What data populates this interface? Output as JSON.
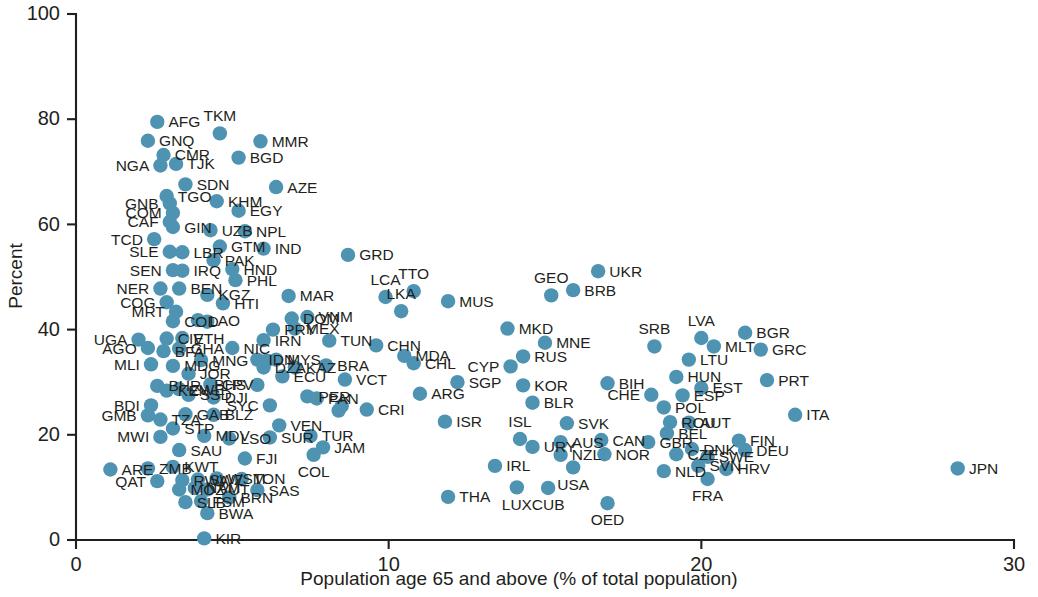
{
  "chart_data": {
    "type": "scatter",
    "title": "",
    "subtitle": "",
    "xlabel": "Population age 65 and above (% of total population)",
    "ylabel": "Percent",
    "xlim": [
      0,
      30
    ],
    "ylim": [
      0,
      100
    ],
    "xticks": [
      0,
      10,
      20,
      30
    ],
    "yticks": [
      0,
      20,
      40,
      60,
      80,
      100
    ],
    "grid": false,
    "legend": "none",
    "marker_color": "#4e93b2",
    "axis_color": "#231f20",
    "point_label_field": "iso3",
    "points": [
      {
        "iso3": "AFG",
        "x": 2.6,
        "y": 79.5,
        "lp": "right"
      },
      {
        "iso3": "GNQ",
        "x": 2.3,
        "y": 75.9,
        "lp": "right"
      },
      {
        "iso3": "CMR",
        "x": 2.8,
        "y": 73.2,
        "lp": "right"
      },
      {
        "iso3": "NGA",
        "x": 2.7,
        "y": 71.2,
        "lp": "left"
      },
      {
        "iso3": "TJK",
        "x": 3.2,
        "y": 71.5,
        "lp": "right"
      },
      {
        "iso3": "TKM",
        "x": 4.6,
        "y": 77.3,
        "lp": "above"
      },
      {
        "iso3": "MMR",
        "x": 5.9,
        "y": 75.8,
        "lp": "right"
      },
      {
        "iso3": "BGD",
        "x": 5.2,
        "y": 72.7,
        "lp": "right"
      },
      {
        "iso3": "SDN",
        "x": 3.5,
        "y": 67.6,
        "lp": "right"
      },
      {
        "iso3": "AZE",
        "x": 6.4,
        "y": 67.1,
        "lp": "right"
      },
      {
        "iso3": "TGO",
        "x": 2.9,
        "y": 65.4,
        "lp": "right"
      },
      {
        "iso3": "GNB",
        "x": 3.0,
        "y": 64.0,
        "lp": "left"
      },
      {
        "iso3": "KHM",
        "x": 4.5,
        "y": 64.4,
        "lp": "right"
      },
      {
        "iso3": "COM",
        "x": 3.1,
        "y": 62.2,
        "lp": "left"
      },
      {
        "iso3": "EGY",
        "x": 5.2,
        "y": 62.6,
        "lp": "right"
      },
      {
        "iso3": "CAF",
        "x": 3.0,
        "y": 60.5,
        "lp": "left"
      },
      {
        "iso3": "GIN",
        "x": 3.1,
        "y": 59.5,
        "lp": "right"
      },
      {
        "iso3": "UZB",
        "x": 4.3,
        "y": 58.9,
        "lp": "right"
      },
      {
        "iso3": "NPL",
        "x": 5.4,
        "y": 58.7,
        "lp": "right"
      },
      {
        "iso3": "TCD",
        "x": 2.5,
        "y": 57.2,
        "lp": "left"
      },
      {
        "iso3": "GTM",
        "x": 4.6,
        "y": 55.8,
        "lp": "right"
      },
      {
        "iso3": "IND",
        "x": 6.0,
        "y": 55.4,
        "lp": "right"
      },
      {
        "iso3": "SLE",
        "x": 3.0,
        "y": 54.8,
        "lp": "left"
      },
      {
        "iso3": "LBR",
        "x": 3.4,
        "y": 54.7,
        "lp": "right"
      },
      {
        "iso3": "PAK",
        "x": 4.4,
        "y": 53.2,
        "lp": "right"
      },
      {
        "iso3": "GRD",
        "x": 8.7,
        "y": 54.2,
        "lp": "right"
      },
      {
        "iso3": "SEN",
        "x": 3.1,
        "y": 51.3,
        "lp": "left"
      },
      {
        "iso3": "IRQ",
        "x": 3.4,
        "y": 51.2,
        "lp": "right"
      },
      {
        "iso3": "HND",
        "x": 5.0,
        "y": 51.5,
        "lp": "right"
      },
      {
        "iso3": "PHL",
        "x": 5.1,
        "y": 49.4,
        "lp": "right"
      },
      {
        "iso3": "LCA",
        "x": 9.9,
        "y": 46.2,
        "lp": "above"
      },
      {
        "iso3": "TTO",
        "x": 10.8,
        "y": 47.3,
        "lp": "above"
      },
      {
        "iso3": "GEO",
        "x": 15.2,
        "y": 46.5,
        "lp": "above"
      },
      {
        "iso3": "UKR",
        "x": 16.7,
        "y": 51.1,
        "lp": "right"
      },
      {
        "iso3": "NER",
        "x": 2.7,
        "y": 47.8,
        "lp": "left"
      },
      {
        "iso3": "BEN",
        "x": 3.3,
        "y": 47.8,
        "lp": "right"
      },
      {
        "iso3": "KGZ",
        "x": 4.2,
        "y": 46.6,
        "lp": "right"
      },
      {
        "iso3": "COG",
        "x": 2.9,
        "y": 45.2,
        "lp": "left"
      },
      {
        "iso3": "MRT",
        "x": 3.2,
        "y": 43.4,
        "lp": "left"
      },
      {
        "iso3": "HTI",
        "x": 4.7,
        "y": 45.0,
        "lp": "right"
      },
      {
        "iso3": "MAR",
        "x": 6.8,
        "y": 46.4,
        "lp": "right"
      },
      {
        "iso3": "BRB",
        "x": 15.9,
        "y": 47.5,
        "lp": "right"
      },
      {
        "iso3": "MUS",
        "x": 11.9,
        "y": 45.4,
        "lp": "right"
      },
      {
        "iso3": "LKA",
        "x": 10.4,
        "y": 43.5,
        "lp": "above"
      },
      {
        "iso3": "DOM",
        "x": 6.9,
        "y": 42.1,
        "lp": "right"
      },
      {
        "iso3": "VNM",
        "x": 7.4,
        "y": 42.4,
        "lp": "right"
      },
      {
        "iso3": "COD",
        "x": 3.1,
        "y": 41.6,
        "lp": "right"
      },
      {
        "iso3": "LAO",
        "x": 3.9,
        "y": 41.8,
        "lp": "right"
      },
      {
        "iso3": "HTI2",
        "x": 4.2,
        "y": 41.5,
        "lp": "hidden"
      },
      {
        "iso3": "PRY",
        "x": 6.3,
        "y": 40.0,
        "lp": "right"
      },
      {
        "iso3": "MEX",
        "x": 7.0,
        "y": 40.2,
        "lp": "right"
      },
      {
        "iso3": "IRN",
        "x": 6.0,
        "y": 38.0,
        "lp": "right"
      },
      {
        "iso3": "CIV",
        "x": 2.9,
        "y": 38.3,
        "lp": "right"
      },
      {
        "iso3": "ETH",
        "x": 3.4,
        "y": 38.4,
        "lp": "right"
      },
      {
        "iso3": "UGA",
        "x": 2.0,
        "y": 38.1,
        "lp": "left"
      },
      {
        "iso3": "AGO",
        "x": 2.3,
        "y": 36.5,
        "lp": "left"
      },
      {
        "iso3": "BFA",
        "x": 2.8,
        "y": 35.9,
        "lp": "right"
      },
      {
        "iso3": "GHA",
        "x": 3.3,
        "y": 36.4,
        "lp": "right"
      },
      {
        "iso3": "NIC",
        "x": 5.0,
        "y": 36.5,
        "lp": "right"
      },
      {
        "iso3": "TUN",
        "x": 8.1,
        "y": 37.9,
        "lp": "right"
      },
      {
        "iso3": "CHN",
        "x": 9.6,
        "y": 37.0,
        "lp": "right"
      },
      {
        "iso3": "MKD",
        "x": 13.8,
        "y": 40.2,
        "lp": "right"
      },
      {
        "iso3": "MNE",
        "x": 15.0,
        "y": 37.5,
        "lp": "right"
      },
      {
        "iso3": "SRB",
        "x": 18.5,
        "y": 36.8,
        "lp": "above"
      },
      {
        "iso3": "LVA",
        "x": 20.0,
        "y": 38.4,
        "lp": "above"
      },
      {
        "iso3": "BGR",
        "x": 21.4,
        "y": 39.4,
        "lp": "right"
      },
      {
        "iso3": "MLT",
        "x": 20.4,
        "y": 36.8,
        "lp": "right"
      },
      {
        "iso3": "GRC",
        "x": 21.9,
        "y": 36.2,
        "lp": "right"
      },
      {
        "iso3": "MDA",
        "x": 10.5,
        "y": 35.0,
        "lp": "right"
      },
      {
        "iso3": "CHL",
        "x": 10.8,
        "y": 33.6,
        "lp": "right"
      },
      {
        "iso3": "RUS",
        "x": 14.3,
        "y": 34.9,
        "lp": "right"
      },
      {
        "iso3": "CYP",
        "x": 13.9,
        "y": 33.0,
        "lp": "left"
      },
      {
        "iso3": "LTU",
        "x": 19.6,
        "y": 34.3,
        "lp": "right"
      },
      {
        "iso3": "MLI",
        "x": 2.4,
        "y": 33.4,
        "lp": "left"
      },
      {
        "iso3": "MDG",
        "x": 3.1,
        "y": 33.1,
        "lp": "right"
      },
      {
        "iso3": "MNG",
        "x": 4.0,
        "y": 34.2,
        "lp": "right"
      },
      {
        "iso3": "JOR",
        "x": 3.6,
        "y": 31.6,
        "lp": "right"
      },
      {
        "iso3": "IDN",
        "x": 5.8,
        "y": 34.3,
        "lp": "right"
      },
      {
        "iso3": "KHM2",
        "x": 6.1,
        "y": 34.1,
        "lp": "hidden"
      },
      {
        "iso3": "MYS",
        "x": 6.4,
        "y": 34.3,
        "lp": "right"
      },
      {
        "iso3": "DZA",
        "x": 6.0,
        "y": 32.8,
        "lp": "right"
      },
      {
        "iso3": "BRA",
        "x": 8.0,
        "y": 33.2,
        "lp": "right"
      },
      {
        "iso3": "KAZ",
        "x": 7.0,
        "y": 32.8,
        "lp": "right"
      },
      {
        "iso3": "ECU",
        "x": 6.6,
        "y": 31.1,
        "lp": "right"
      },
      {
        "iso3": "BHR",
        "x": 2.6,
        "y": 29.3,
        "lp": "right"
      },
      {
        "iso3": "KEN",
        "x": 2.9,
        "y": 28.4,
        "lp": "right"
      },
      {
        "iso3": "ZWE",
        "x": 3.3,
        "y": 28.7,
        "lp": "right"
      },
      {
        "iso3": "SSD",
        "x": 3.6,
        "y": 27.6,
        "lp": "right"
      },
      {
        "iso3": "CPV",
        "x": 4.3,
        "y": 29.6,
        "lp": "right"
      },
      {
        "iso3": "DJI",
        "x": 4.4,
        "y": 27.1,
        "lp": "right"
      },
      {
        "iso3": "BHS",
        "x": 5.8,
        "y": 29.5,
        "lp": "left"
      },
      {
        "iso3": "VCT",
        "x": 8.6,
        "y": 30.5,
        "lp": "right"
      },
      {
        "iso3": "SGP",
        "x": 12.2,
        "y": 30.0,
        "lp": "right"
      },
      {
        "iso3": "KOR",
        "x": 14.3,
        "y": 29.4,
        "lp": "right"
      },
      {
        "iso3": "BIH",
        "x": 17.0,
        "y": 29.8,
        "lp": "right"
      },
      {
        "iso3": "HUN",
        "x": 19.2,
        "y": 31.0,
        "lp": "right"
      },
      {
        "iso3": "EST",
        "x": 20.0,
        "y": 28.9,
        "lp": "right"
      },
      {
        "iso3": "PRT",
        "x": 22.1,
        "y": 30.4,
        "lp": "right"
      },
      {
        "iso3": "PER",
        "x": 7.4,
        "y": 27.3,
        "lp": "right"
      },
      {
        "iso3": "PAN",
        "x": 7.7,
        "y": 26.9,
        "lp": "right"
      },
      {
        "iso3": "ARG",
        "x": 11.0,
        "y": 27.8,
        "lp": "right"
      },
      {
        "iso3": "CHE",
        "x": 18.4,
        "y": 27.6,
        "lp": "left"
      },
      {
        "iso3": "ESP",
        "x": 19.4,
        "y": 27.5,
        "lp": "right"
      },
      {
        "iso3": "BDI",
        "x": 2.4,
        "y": 25.6,
        "lp": "left"
      },
      {
        "iso3": "GMB",
        "x": 2.3,
        "y": 23.7,
        "lp": "left"
      },
      {
        "iso3": "TZA",
        "x": 2.7,
        "y": 22.9,
        "lp": "right"
      },
      {
        "iso3": "GAB",
        "x": 3.5,
        "y": 23.9,
        "lp": "right"
      },
      {
        "iso3": "BLZ",
        "x": 4.4,
        "y": 23.8,
        "lp": "right"
      },
      {
        "iso3": "SYC",
        "x": 6.2,
        "y": 25.6,
        "lp": "left"
      },
      {
        "iso3": "BRA2",
        "x": 8.5,
        "y": 25.5,
        "lp": "hidden"
      },
      {
        "iso3": "AFG2",
        "x": 8.4,
        "y": 24.6,
        "lp": "hidden"
      },
      {
        "iso3": "CRI",
        "x": 9.3,
        "y": 24.8,
        "lp": "right"
      },
      {
        "iso3": "ISR",
        "x": 11.8,
        "y": 22.5,
        "lp": "right"
      },
      {
        "iso3": "BLR",
        "x": 14.6,
        "y": 26.1,
        "lp": "right"
      },
      {
        "iso3": "POL",
        "x": 18.8,
        "y": 25.2,
        "lp": "right"
      },
      {
        "iso3": "ITA",
        "x": 23.0,
        "y": 23.8,
        "lp": "right"
      },
      {
        "iso3": "STP",
        "x": 3.1,
        "y": 21.2,
        "lp": "right"
      },
      {
        "iso3": "VEN",
        "x": 6.5,
        "y": 21.8,
        "lp": "right"
      },
      {
        "iso3": "TUR",
        "x": 7.5,
        "y": 19.8,
        "lp": "right"
      },
      {
        "iso3": "SVK",
        "x": 15.7,
        "y": 22.2,
        "lp": "right"
      },
      {
        "iso3": "ROU",
        "x": 19.0,
        "y": 22.4,
        "lp": "right"
      },
      {
        "iso3": "AUT",
        "x": 19.6,
        "y": 22.3,
        "lp": "right"
      },
      {
        "iso3": "MWI",
        "x": 2.7,
        "y": 19.6,
        "lp": "left"
      },
      {
        "iso3": "MDV",
        "x": 4.1,
        "y": 19.8,
        "lp": "right"
      },
      {
        "iso3": "LSO",
        "x": 4.9,
        "y": 19.3,
        "lp": "right"
      },
      {
        "iso3": "SUR",
        "x": 6.2,
        "y": 19.5,
        "lp": "right"
      },
      {
        "iso3": "ISL",
        "x": 14.2,
        "y": 19.2,
        "lp": "above"
      },
      {
        "iso3": "FIN",
        "x": 21.2,
        "y": 18.9,
        "lp": "right"
      },
      {
        "iso3": "BEL",
        "x": 18.9,
        "y": 20.3,
        "lp": "right"
      },
      {
        "iso3": "SAU",
        "x": 3.3,
        "y": 17.1,
        "lp": "right"
      },
      {
        "iso3": "JAM",
        "x": 7.9,
        "y": 17.6,
        "lp": "right"
      },
      {
        "iso3": "COL",
        "x": 7.6,
        "y": 16.2,
        "lp": "below"
      },
      {
        "iso3": "AUS",
        "x": 15.5,
        "y": 18.6,
        "lp": "right"
      },
      {
        "iso3": "CAN",
        "x": 16.8,
        "y": 19.0,
        "lp": "right"
      },
      {
        "iso3": "GBR",
        "x": 18.3,
        "y": 18.6,
        "lp": "right"
      },
      {
        "iso3": "URY",
        "x": 14.6,
        "y": 17.7,
        "lp": "right"
      },
      {
        "iso3": "ARE",
        "x": 1.1,
        "y": 13.4,
        "lp": "right"
      },
      {
        "iso3": "ZMB",
        "x": 2.3,
        "y": 13.6,
        "lp": "right"
      },
      {
        "iso3": "KWT",
        "x": 3.1,
        "y": 13.9,
        "lp": "right"
      },
      {
        "iso3": "FJI",
        "x": 5.4,
        "y": 15.5,
        "lp": "right"
      },
      {
        "iso3": "NZL",
        "x": 15.5,
        "y": 16.2,
        "lp": "right"
      },
      {
        "iso3": "NOR",
        "x": 16.9,
        "y": 16.3,
        "lp": "right"
      },
      {
        "iso3": "DNK",
        "x": 19.7,
        "y": 17.3,
        "lp": "right"
      },
      {
        "iso3": "CZE",
        "x": 19.2,
        "y": 16.3,
        "lp": "right"
      },
      {
        "iso3": "SWE",
        "x": 20.2,
        "y": 15.8,
        "lp": "right"
      },
      {
        "iso3": "DEU",
        "x": 21.4,
        "y": 17.1,
        "lp": "right"
      },
      {
        "iso3": "IRL",
        "x": 13.4,
        "y": 14.1,
        "lp": "right"
      },
      {
        "iso3": "QAT",
        "x": 2.6,
        "y": 11.2,
        "lp": "left"
      },
      {
        "iso3": "RWA",
        "x": 3.4,
        "y": 11.4,
        "lp": "right"
      },
      {
        "iso3": "SWZ",
        "x": 3.9,
        "y": 11.5,
        "lp": "right"
      },
      {
        "iso3": "WSM",
        "x": 4.5,
        "y": 11.7,
        "lp": "right"
      },
      {
        "iso3": "TON",
        "x": 5.3,
        "y": 11.6,
        "lp": "right"
      },
      {
        "iso3": "MOZ",
        "x": 3.3,
        "y": 9.6,
        "lp": "right"
      },
      {
        "iso3": "NAM",
        "x": 3.8,
        "y": 9.9,
        "lp": "right"
      },
      {
        "iso3": "VUT",
        "x": 4.2,
        "y": 9.6,
        "lp": "right"
      },
      {
        "iso3": "SAS",
        "x": 5.8,
        "y": 9.5,
        "lp": "right"
      },
      {
        "iso3": "SLB",
        "x": 3.5,
        "y": 7.2,
        "lp": "right"
      },
      {
        "iso3": "FSM",
        "x": 4.0,
        "y": 7.4,
        "lp": "right"
      },
      {
        "iso3": "BRN",
        "x": 4.9,
        "y": 8.1,
        "lp": "right"
      },
      {
        "iso3": "BWA",
        "x": 4.2,
        "y": 5.1,
        "lp": "right"
      },
      {
        "iso3": "KIR",
        "x": 4.1,
        "y": 0.3,
        "lp": "right"
      },
      {
        "iso3": "THA",
        "x": 11.9,
        "y": 8.2,
        "lp": "right"
      },
      {
        "iso3": "LUX",
        "x": 14.1,
        "y": 10.0,
        "lp": "below"
      },
      {
        "iso3": "CUB",
        "x": 15.1,
        "y": 9.9,
        "lp": "below"
      },
      {
        "iso3": "USA",
        "x": 15.9,
        "y": 13.8,
        "lp": "below"
      },
      {
        "iso3": "OED",
        "x": 17.0,
        "y": 7.0,
        "lp": "below"
      },
      {
        "iso3": "NLD",
        "x": 18.8,
        "y": 13.1,
        "lp": "right"
      },
      {
        "iso3": "SVN",
        "x": 19.9,
        "y": 14.1,
        "lp": "right"
      },
      {
        "iso3": "HRV",
        "x": 20.8,
        "y": 13.5,
        "lp": "right"
      },
      {
        "iso3": "FRA",
        "x": 20.2,
        "y": 11.6,
        "lp": "below"
      },
      {
        "iso3": "JPN",
        "x": 28.2,
        "y": 13.6,
        "lp": "right"
      }
    ]
  },
  "axes": {
    "y_title": "Percent",
    "x_title": "Population age 65 and above (% of total population)",
    "y_tick_labels": [
      "0",
      "20",
      "40",
      "60",
      "80",
      "100"
    ],
    "x_tick_labels": [
      "0",
      "10",
      "20",
      "30"
    ]
  }
}
